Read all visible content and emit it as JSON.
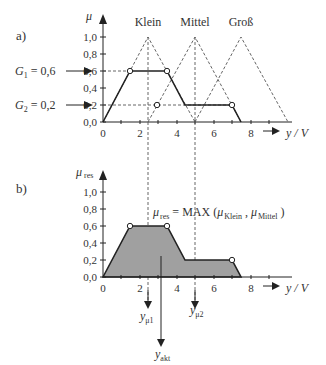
{
  "panel_a": {
    "label": "a)",
    "y_axis_symbol": "μ",
    "y_ticks": [
      "0,0",
      "0,2",
      "0,4",
      "0,6",
      "0,8",
      "1,0"
    ],
    "x_ticks": [
      "0",
      "2",
      "4",
      "6",
      "8"
    ],
    "x_axis_label": "y / V",
    "sets": [
      "Klein",
      "Mittel",
      "Groß"
    ],
    "g1_label": "G",
    "g1_sub": "1",
    "g1_value": " = 0,6",
    "g2_label": "G",
    "g2_sub": "2",
    "g2_value": " = 0,2"
  },
  "panel_b": {
    "label": "b)",
    "y_axis_symbol": "μ",
    "y_axis_sub": "res",
    "y_ticks": [
      "0,0",
      "0,2",
      "0,4",
      "0,6",
      "0,8",
      "1,0"
    ],
    "x_ticks": [
      "0",
      "2",
      "4",
      "6",
      "8"
    ],
    "x_axis_label": "y / V",
    "formula_mu": "μ",
    "formula_res": "res",
    "formula_mid": " = MAX (",
    "formula_mu1": "μ",
    "formula_klein": "Klein",
    "formula_comma": " , ",
    "formula_mu2": "μ",
    "formula_mittel": "Mittel",
    "formula_end": " )",
    "y_mu1": "y",
    "y_mu1_sub": "μ1",
    "y_mu2": "y",
    "y_mu2_sub": "μ2",
    "y_akt": "y",
    "y_akt_sub": "akt"
  },
  "colors": {
    "line": "#222222",
    "dashed": "#555555",
    "fill": "#a0a0a0"
  }
}
